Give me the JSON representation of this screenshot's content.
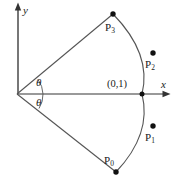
{
  "figure": {
    "background_color": "#ffffff",
    "stroke_color": "#4d4d4d",
    "text_color": "#1a1a1a",
    "width": 174,
    "height": 183
  },
  "axes": {
    "x_label": "x",
    "y_label": "y",
    "origin": {
      "x": 17,
      "y": 94
    },
    "x_axis": {
      "from_x": 17,
      "to_x": 170,
      "y": 94,
      "arrow": "right"
    },
    "y_axis": {
      "x": 18,
      "from_y": 94,
      "to_y": 4,
      "arrow": "up"
    }
  },
  "angles": [
    {
      "name": "theta-upper",
      "label": "θ"
    },
    {
      "name": "theta-lower",
      "label": "θ"
    }
  ],
  "annotations": {
    "unit_point_label": "(0,1)"
  },
  "points": [
    {
      "id": "P0",
      "base": "P",
      "sub": "0",
      "label": "P0",
      "dot_x": 116,
      "dot_y": 172,
      "label_x": 104,
      "label_y": 155
    },
    {
      "id": "P1",
      "base": "P",
      "sub": "1",
      "label": "P1",
      "dot_x": 153,
      "dot_y": 126,
      "label_x": 145,
      "label_y": 132
    },
    {
      "id": "P2",
      "base": "P",
      "sub": "2",
      "label": "P2",
      "dot_x": 153,
      "dot_y": 53,
      "label_x": 145,
      "label_y": 59
    },
    {
      "id": "P3",
      "base": "P",
      "sub": "3",
      "label": "P3",
      "dot_x": 113,
      "dot_y": 14,
      "label_x": 105,
      "label_y": 22
    }
  ]
}
